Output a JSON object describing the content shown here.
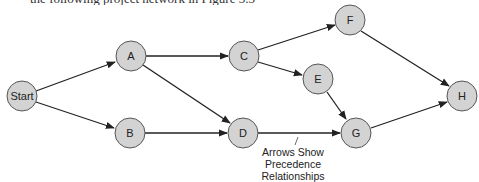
{
  "top_fragment": "the following project network in Figure 3.3",
  "colors": {
    "node_fill": "#d3d3d3",
    "node_stroke": "#555555",
    "edge": "#222222"
  },
  "nodes": [
    {
      "id": "start",
      "label": "Start",
      "x": 22,
      "y": 96
    },
    {
      "id": "a",
      "label": "A",
      "x": 131,
      "y": 56
    },
    {
      "id": "b",
      "label": "B",
      "x": 130,
      "y": 133
    },
    {
      "id": "c",
      "label": "C",
      "x": 244,
      "y": 56
    },
    {
      "id": "d",
      "label": "D",
      "x": 243,
      "y": 133
    },
    {
      "id": "e",
      "label": "E",
      "x": 318,
      "y": 79
    },
    {
      "id": "f",
      "label": "F",
      "x": 350,
      "y": 20
    },
    {
      "id": "g",
      "label": "G",
      "x": 356,
      "y": 133
    },
    {
      "id": "h",
      "label": "H",
      "x": 462,
      "y": 96
    }
  ],
  "edges": [
    {
      "from": "Start",
      "to": "A"
    },
    {
      "from": "Start",
      "to": "B"
    },
    {
      "from": "A",
      "to": "C"
    },
    {
      "from": "A",
      "to": "D"
    },
    {
      "from": "B",
      "to": "D"
    },
    {
      "from": "C",
      "to": "F"
    },
    {
      "from": "C",
      "to": "E"
    },
    {
      "from": "D",
      "to": "G"
    },
    {
      "from": "E",
      "to": "G"
    },
    {
      "from": "F",
      "to": "H"
    },
    {
      "from": "G",
      "to": "H"
    }
  ],
  "annotation": {
    "lines": [
      "Arrows Show",
      "Precedence",
      "Relationships"
    ]
  }
}
